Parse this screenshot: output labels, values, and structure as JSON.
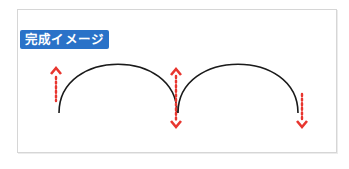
{
  "label": {
    "text": "完成イメージ",
    "color": "#2a72c8"
  },
  "colors": {
    "arc": "#1a1a1a",
    "arrow": "#e8362f",
    "frame": "#d6d6d6"
  },
  "arcs": [
    {
      "name": "left-arc",
      "start": [
        59,
        113
      ],
      "end": [
        177,
        113
      ],
      "peak_y": 63
    },
    {
      "name": "right-arc",
      "start": [
        178,
        113
      ],
      "end": [
        298,
        113
      ],
      "peak_y": 63
    }
  ],
  "arrows": [
    {
      "name": "left-up-arrow",
      "direction": "up",
      "x": 56
    },
    {
      "name": "middle-up-down-arrow",
      "direction": "up-down",
      "x": 178
    },
    {
      "name": "right-down-arrow",
      "direction": "down",
      "x": 302
    }
  ]
}
